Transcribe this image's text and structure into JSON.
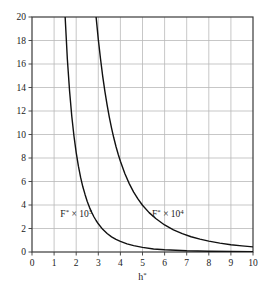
{
  "chart_data": {
    "type": "line",
    "title": "",
    "subtitle": "",
    "xlabel": "h*",
    "ylabel": "",
    "xlim": [
      0,
      10
    ],
    "ylim": [
      0,
      20
    ],
    "grid": true,
    "legend_position": "inline-annotation",
    "background_color": "#ffffff",
    "axis_color": "#3a3a3a",
    "grid_color": "#b9b9b9",
    "curve_color": "#111111",
    "xticks": [
      0,
      1,
      2,
      3,
      4,
      5,
      6,
      7,
      8,
      9,
      10
    ],
    "xtick_labels": [
      "0",
      "1",
      "2",
      "3",
      "4",
      "5",
      "6",
      "7",
      "8",
      "9",
      "10"
    ],
    "yticks": [
      0,
      2,
      4,
      6,
      8,
      10,
      12,
      14,
      16,
      18,
      20
    ],
    "ytick_labels": [
      "0",
      "2",
      "4",
      "6",
      "8",
      "10",
      "12",
      "14",
      "16",
      "18",
      "20"
    ],
    "annotations": [
      {
        "name": "curve-1-label",
        "base": "F",
        "star": "*",
        "times": " × 10",
        "exponent": "3",
        "text": "F* × 10³",
        "x": 2.0,
        "y": 3.0
      },
      {
        "name": "curve-2-label",
        "base": "F",
        "star": "*",
        "times": " × 10",
        "exponent": "4",
        "text": "F* × 10⁴",
        "x": 6.15,
        "y": 3.0
      }
    ],
    "series": [
      {
        "name": "F* × 10³",
        "x": [
          1.5,
          1.6,
          1.7,
          1.8,
          1.9,
          2.0,
          2.1,
          2.2,
          2.3,
          2.4,
          2.5,
          2.6,
          2.7,
          2.8,
          2.9,
          3.0,
          3.2,
          3.4,
          3.6,
          3.8,
          4.0,
          4.3,
          4.6,
          5.0,
          5.5,
          6.0,
          7.0,
          8.0,
          9.0,
          10.0
        ],
        "y": [
          20.0,
          16.4,
          13.7,
          11.55,
          9.85,
          8.45,
          7.3,
          6.35,
          5.55,
          4.9,
          4.3,
          3.8,
          3.38,
          3.0,
          2.68,
          2.4,
          1.93,
          1.57,
          1.29,
          1.07,
          0.9,
          0.69,
          0.54,
          0.39,
          0.26,
          0.19,
          0.1,
          0.06,
          0.04,
          0.03
        ]
      },
      {
        "name": "F* × 10⁴",
        "x": [
          2.9,
          3.0,
          3.1,
          3.2,
          3.3,
          3.4,
          3.5,
          3.6,
          3.7,
          3.8,
          3.9,
          4.0,
          4.2,
          4.4,
          4.6,
          4.8,
          5.0,
          5.3,
          5.6,
          6.0,
          6.4,
          6.8,
          7.2,
          7.6,
          8.0,
          8.5,
          9.0,
          9.5,
          10.0
        ],
        "y": [
          20.0,
          18.1,
          16.45,
          14.95,
          13.65,
          12.5,
          11.45,
          10.55,
          9.72,
          8.98,
          8.32,
          7.72,
          6.68,
          5.82,
          5.1,
          4.5,
          3.98,
          3.35,
          2.85,
          2.3,
          1.88,
          1.56,
          1.3,
          1.1,
          0.93,
          0.76,
          0.62,
          0.52,
          0.44
        ]
      }
    ]
  },
  "layout": {
    "plot_left": 32,
    "plot_top": 17,
    "plot_right": 253,
    "plot_bottom": 252
  }
}
